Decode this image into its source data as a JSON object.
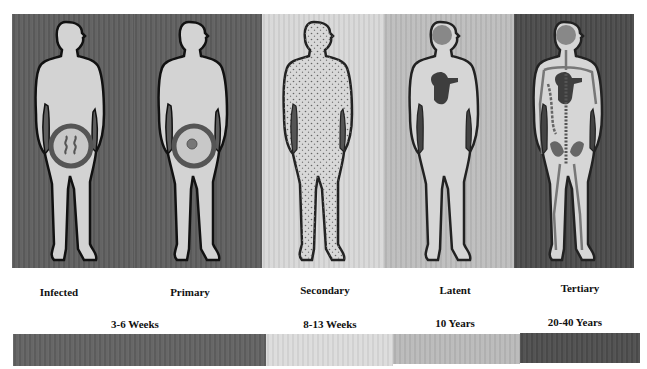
{
  "stages": [
    {
      "label": "Infected",
      "bg": "#5e5e5e",
      "figure": "lesion-spirochetes"
    },
    {
      "label": "Primary",
      "bg": "#5e5e5e",
      "figure": "lesion-chancre"
    },
    {
      "label": "Secondary",
      "bg": "#d8d8d8",
      "figure": "rash-dots"
    },
    {
      "label": "Latent",
      "bg": "#bdbdbd",
      "figure": "organs-brain-heart"
    },
    {
      "label": "Tertiary",
      "bg": "#4a4a4a",
      "figure": "systemic-organs"
    }
  ],
  "timeline": [
    {
      "label": "3-6 Weeks",
      "color": "#616161"
    },
    {
      "label": "8-13 Weeks",
      "color": "#dcdcdc"
    },
    {
      "label": "10 Years",
      "color": "#b9b9b9"
    },
    {
      "label": "20-40 Years",
      "color": "#4d4d4d"
    }
  ],
  "colors": {
    "figure_fill": "#d3d3d3",
    "outline": "#111111",
    "organ": "#707070",
    "organ_dark": "#3a3a3a"
  }
}
